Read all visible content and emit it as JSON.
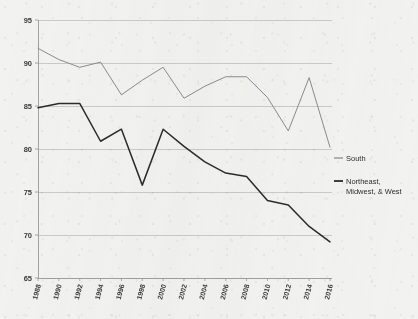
{
  "chart_data": {
    "type": "line",
    "title": "",
    "subtitle": "",
    "xlabel": "",
    "ylabel": "",
    "ylim": [
      65,
      95
    ],
    "yticks": [
      65,
      70,
      75,
      80,
      85,
      90,
      95
    ],
    "grid": true,
    "legend_position": "right",
    "x": [
      1988,
      1990,
      1992,
      1994,
      1996,
      1998,
      2000,
      2002,
      2004,
      2006,
      2008,
      2010,
      2012,
      2014,
      2016
    ],
    "categories": [
      "1988",
      "1990",
      "1992",
      "1994",
      "1996",
      "1998",
      "2000",
      "2002",
      "2004",
      "2006",
      "2008",
      "2010",
      "2012",
      "2014",
      "2016"
    ],
    "series": [
      {
        "name": "South",
        "color": "#8c8c8c",
        "values": [
          91.7,
          90.4,
          89.5,
          90.1,
          86.3,
          88.0,
          89.5,
          85.9,
          87.3,
          88.4,
          88.4,
          86.0,
          82.1,
          88.3,
          80.2
        ]
      },
      {
        "name": "Northeast, Midwest, & West",
        "color": "#2b2b2b",
        "values": [
          84.8,
          85.3,
          85.3,
          80.9,
          82.3,
          75.8,
          82.3,
          80.3,
          78.5,
          77.2,
          76.8,
          74.0,
          73.5,
          71.0,
          69.2
        ]
      }
    ]
  },
  "axis": {
    "y_tick_labels": [
      "95",
      "90",
      "85",
      "80",
      "75",
      "70",
      "65"
    ],
    "x_tick_labels": [
      "1988",
      "1990",
      "1992",
      "1994",
      "1996",
      "1998",
      "2000",
      "2002",
      "2004",
      "2006",
      "2008",
      "2010",
      "2012",
      "2014",
      "2016"
    ]
  },
  "legend": {
    "entries": [
      {
        "label": "South",
        "color": "#8c8c8c"
      },
      {
        "label": "Northeast,",
        "label2": "Midwest, & West",
        "color": "#2b2b2b"
      }
    ],
    "entry_0_label": "South",
    "entry_1_label_line1": "Northeast,",
    "entry_1_label_line2": "Midwest, & West"
  },
  "colors": {
    "background": "#f2f2f0",
    "grid": "#b9b9b7",
    "axis": "#9a9a98",
    "south_line": "#8c8c8c",
    "other_line": "#2b2b2b",
    "text": "#3a3a3a"
  }
}
